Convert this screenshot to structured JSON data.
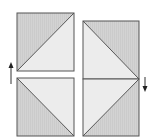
{
  "diagram": {
    "colors": {
      "dark_fill": "#d3d3d3",
      "light_fill": "#ececec",
      "stroke": "#555555",
      "hatch": "#c4c4c4"
    },
    "tiles": [
      {
        "id": "top-left",
        "x": 17,
        "y": 13,
        "size": 57,
        "diagonal": "bottom-left-to-top-right",
        "dark_triangle": "upper-left"
      },
      {
        "id": "bottom-left",
        "x": 17,
        "y": 78,
        "size": 57,
        "diagonal": "top-left-to-bottom-right",
        "dark_triangle": "lower-left"
      },
      {
        "id": "top-right",
        "x": 83,
        "y": 21,
        "size": 57,
        "diagonal": "top-left-to-bottom-right",
        "dark_triangle": "upper-right"
      },
      {
        "id": "bottom-right",
        "x": 83,
        "y": 79,
        "size": 57,
        "diagonal": "bottom-left-to-top-right",
        "dark_triangle": "lower-right"
      }
    ],
    "arrows": [
      {
        "id": "up-arrow",
        "direction": "up",
        "x": 11,
        "y1": 84,
        "y2": 63
      },
      {
        "id": "down-arrow",
        "direction": "down",
        "x": 145,
        "y1": 77,
        "y2": 91
      }
    ]
  }
}
